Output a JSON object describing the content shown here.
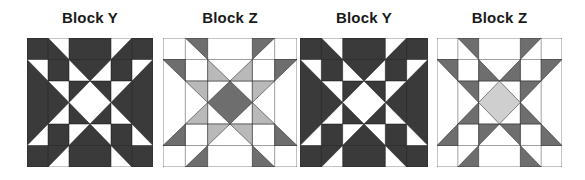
{
  "colors": {
    "dark": "#3a3a3a",
    "mid": "#6e6e6e",
    "light": "#b9b9b9",
    "lighter": "#cfcfcf",
    "white": "#ffffff",
    "line": "#222222"
  },
  "blocks": [
    {
      "title": "Block Y",
      "type": "Y",
      "x": 27,
      "width": 126
    },
    {
      "title": "Block Z",
      "type": "Z",
      "x": 163,
      "width": 134,
      "inner": "light",
      "center": "mid"
    },
    {
      "title": "Block Y",
      "type": "Y",
      "x": 300,
      "width": 128
    },
    {
      "title": "Block Z",
      "type": "Z",
      "x": 437,
      "width": 125,
      "inner": "mid",
      "center": "lighter"
    }
  ]
}
